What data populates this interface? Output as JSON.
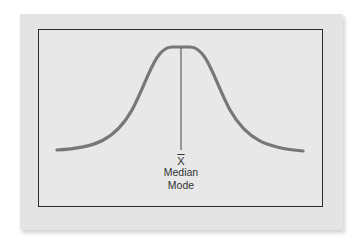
{
  "diagram": {
    "type": "normal-distribution",
    "curve_color": "#777777",
    "frame_color": "#2a2a2a",
    "card_color": "#e4e4e4",
    "center_marker": {
      "symbol": "X",
      "symbol_decoration": "overline",
      "labels": [
        "Median",
        "Mode"
      ]
    }
  }
}
